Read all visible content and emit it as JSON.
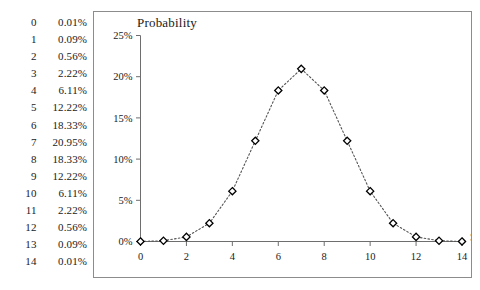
{
  "table": {
    "name": "binomial-probability-table",
    "rows": [
      {
        "k": "0",
        "p": "0.01%"
      },
      {
        "k": "1",
        "p": "0.09%"
      },
      {
        "k": "2",
        "p": "0.56%"
      },
      {
        "k": "3",
        "p": "2.22%"
      },
      {
        "k": "4",
        "p": "6.11%"
      },
      {
        "k": "5",
        "p": "12.22%"
      },
      {
        "k": "6",
        "p": "18.33%"
      },
      {
        "k": "7",
        "p": "20.95%"
      },
      {
        "k": "8",
        "p": "18.33%"
      },
      {
        "k": "9",
        "p": "12.22%"
      },
      {
        "k": "10",
        "p": "6.11%"
      },
      {
        "k": "11",
        "p": "2.22%"
      },
      {
        "k": "12",
        "p": "0.56%"
      },
      {
        "k": "13",
        "p": "0.09%"
      },
      {
        "k": "14",
        "p": "0.01%"
      }
    ]
  },
  "chart_data": {
    "type": "line",
    "title": "Probability",
    "xlabel": "S",
    "ylabel": "",
    "x": [
      0,
      1,
      2,
      3,
      4,
      5,
      6,
      7,
      8,
      9,
      10,
      11,
      12,
      13,
      14
    ],
    "values": [
      0.01,
      0.09,
      0.56,
      2.22,
      6.11,
      12.22,
      18.33,
      20.95,
      18.33,
      12.22,
      6.11,
      2.22,
      0.56,
      0.09,
      0.01
    ],
    "value_labels": [
      "0.01%",
      "0.09%",
      "0.56%",
      "2.22%",
      "6.11%",
      "12.22%",
      "18.33%",
      "20.95%",
      "18.33%",
      "12.22%",
      "6.11%",
      "2.22%",
      "0.56%",
      "0.09%",
      "0.01%"
    ],
    "xlim": [
      0,
      14
    ],
    "ylim": [
      0,
      25
    ],
    "xticks": [
      0,
      2,
      4,
      6,
      8,
      10,
      12,
      14
    ],
    "xticklabels": [
      "0",
      "2",
      "4",
      "6",
      "8",
      "10",
      "12",
      "14"
    ],
    "yticks": [
      0,
      5,
      10,
      15,
      20,
      25
    ],
    "yticklabels": [
      "0%",
      "5%",
      "10%",
      "15%",
      "20%",
      "25%"
    ],
    "grid": false,
    "legend": null,
    "marker": "diamond",
    "marker_fill": "#ffffff",
    "marker_stroke": "#000000",
    "line_style": "dotted",
    "line_color": "#555555",
    "axis_color": "#6e6e6e",
    "frame_color": "#8c8c8c"
  }
}
